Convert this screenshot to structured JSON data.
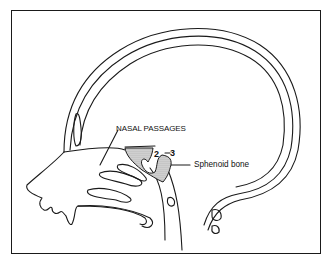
{
  "diagram": {
    "labels": {
      "nasal_passages": "NASAL PASSAGES",
      "sphenoid_bone": "Sphenoid bone",
      "marker_2": "2",
      "marker_3": "3"
    },
    "colors": {
      "line": "#1a1a1a",
      "background": "#ffffff",
      "shading": "#bdbdbd"
    }
  }
}
